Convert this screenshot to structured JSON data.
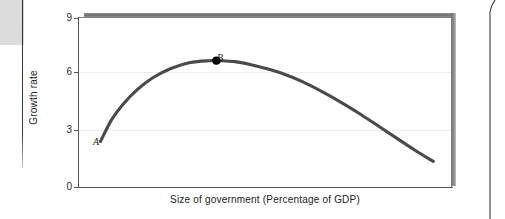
{
  "figure": {
    "kind": "scanned-textbook-figure",
    "background_color": "#ffffff",
    "frame_border_color": "#7d7d7d",
    "shadow_color": "#6f6f6f",
    "curve_color": "#4a4a4a",
    "marker_color": "#000000",
    "gridline_color": "#ececec"
  },
  "chart_data": {
    "type": "line",
    "title": "",
    "subtitle": "",
    "xlabel": "Size of government (Percentage of GDP)",
    "ylabel": "Growth rate",
    "xlim": [
      0,
      100
    ],
    "ylim": [
      0,
      9
    ],
    "xticks": [],
    "xticklabels": [],
    "yticks": [
      0,
      3,
      6,
      9
    ],
    "yticklabels": [
      "0",
      "3",
      "6",
      "9"
    ],
    "grid": "horizontal",
    "legend": "none",
    "series": [
      {
        "name": "Growth rate curve",
        "x": [
          6,
          9,
          12,
          16,
          20,
          25,
          30,
          35,
          38,
          42,
          46,
          50,
          55,
          60,
          65,
          70,
          75,
          80,
          85,
          90,
          95
        ],
        "values": [
          2.45,
          3.6,
          4.4,
          5.2,
          5.8,
          6.3,
          6.6,
          6.7,
          6.7,
          6.65,
          6.5,
          6.3,
          6.0,
          5.6,
          5.1,
          4.55,
          3.95,
          3.3,
          2.65,
          2.0,
          1.4
        ]
      }
    ],
    "annotations": [
      {
        "label": "A",
        "style": "italic",
        "marker": "none",
        "x": 4,
        "y": 2.7,
        "note": "label at left start of curve"
      },
      {
        "label": "B",
        "style": "italic",
        "marker": "filled-circle",
        "x": 37,
        "y": 6.7,
        "note": "peak of the curve (growth-maximizing size of government)"
      }
    ]
  },
  "artifacts": {
    "left_gray_block": "scan-shadow-block",
    "left_page_edge": "page-edge-line",
    "right_page_edge": "curved-page-edge-line"
  }
}
